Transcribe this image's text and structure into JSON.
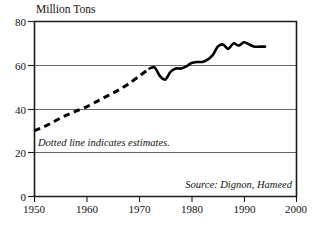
{
  "chart_data": {
    "type": "line",
    "title": "",
    "ylabel": "Million Tons",
    "xlabel": "",
    "xlim": [
      1950,
      2000
    ],
    "ylim": [
      0,
      80
    ],
    "grid": true,
    "legend": "none",
    "y_ticks": [
      "0",
      "20",
      "40",
      "60",
      "80"
    ],
    "y_tick_values": [
      0,
      20,
      40,
      60,
      80
    ],
    "x_ticks": [
      "1950",
      "1960",
      "1970",
      "1980",
      "1990",
      "2000"
    ],
    "x_tick_values": [
      1950,
      1960,
      1970,
      1980,
      1990,
      2000
    ],
    "annotations": [
      "Dotted line indicates estimates.",
      "Source: Dignon, Hameed"
    ],
    "series": [
      {
        "name": "Estimated sulfur emissions (dotted)",
        "style": "dotted",
        "x": [
          1950,
          1952,
          1954,
          1956,
          1958,
          1960,
          1962,
          1964,
          1966,
          1968,
          1970,
          1972
        ],
        "values": [
          30.0,
          32.0,
          34.5,
          37.0,
          39.0,
          41.0,
          43.5,
          46.0,
          48.5,
          51.5,
          55.0,
          58.5
        ]
      },
      {
        "name": "Measured sulfur emissions (solid)",
        "style": "solid",
        "x": [
          1972,
          1973,
          1974,
          1975,
          1976,
          1977,
          1978,
          1979,
          1980,
          1981,
          1982,
          1983,
          1984,
          1985,
          1986,
          1987,
          1988,
          1989,
          1990,
          1991,
          1992,
          1993,
          1994
        ],
        "values": [
          58.5,
          59.0,
          55.0,
          53.5,
          57.0,
          58.5,
          58.5,
          59.5,
          61.0,
          61.5,
          61.5,
          62.5,
          64.5,
          68.5,
          69.5,
          67.5,
          70.0,
          69.0,
          70.5,
          69.5,
          68.5,
          68.5,
          68.5
        ]
      }
    ]
  },
  "axis": {
    "ylabel": "Million Tons"
  },
  "notes": {
    "estimates": "Dotted line indicates estimates.",
    "source": "Source: Dignon, Hameed"
  }
}
